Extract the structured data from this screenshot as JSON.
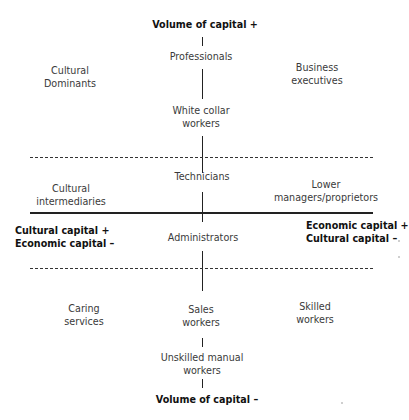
{
  "diagram": {
    "axis_top": "Volume of capital +",
    "axis_bottom": "Volume of capital –",
    "axis_left": [
      "Cultural capital +",
      "Economic capital –"
    ],
    "axis_right": [
      "Economic capital +",
      "Cultural capital –"
    ],
    "center_column": {
      "professionals": "Professionals",
      "white_collar": [
        "White collar",
        "workers"
      ],
      "technicians": "Technicians",
      "administrators": "Administrators",
      "sales": [
        "Sales",
        "workers"
      ],
      "unskilled": [
        "Unskilled manual",
        "workers"
      ]
    },
    "left_column": {
      "cultural_dominants": [
        "Cultural",
        "Dominants"
      ],
      "cultural_intermediaries": [
        "Cultural",
        "intermediaries"
      ],
      "caring_services": [
        "Caring",
        "services"
      ]
    },
    "right_column": {
      "business_executives": [
        "Business",
        "executives"
      ],
      "lower_managers": [
        "Lower",
        "managers/proprietors"
      ],
      "skilled_workers": [
        "Skilled",
        "workers"
      ]
    },
    "colors": {
      "line": "#222222",
      "text": "#3a3a3a",
      "background": "#ffffff"
    }
  }
}
